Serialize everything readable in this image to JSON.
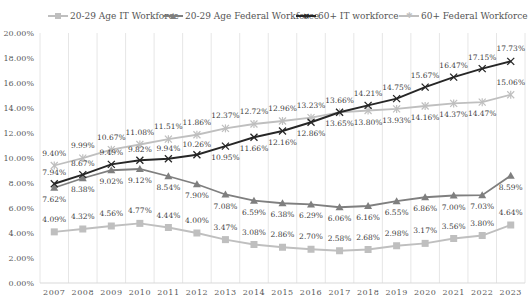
{
  "chart_data": {
    "type": "line",
    "title": "",
    "xlabel": "",
    "ylabel": "",
    "x": [
      "2007",
      "2008",
      "2009",
      "2010",
      "2011",
      "2012",
      "2013",
      "2014",
      "2015",
      "2016",
      "2017",
      "2018",
      "2019",
      "2020",
      "2021",
      "2022",
      "2023"
    ],
    "ylim": [
      0,
      20
    ],
    "yticks": [
      "0.00%",
      "2.00%",
      "4.00%",
      "6.00%",
      "8.00%",
      "10.00%",
      "12.00%",
      "14.00%",
      "16.00%",
      "18.00%",
      "20.00%"
    ],
    "grid": {
      "vertical": true,
      "horizontal": false
    },
    "legend_position": "top",
    "series": [
      {
        "name": "20-29 Age IT Workforce",
        "color": "#bfbfbf",
        "marker": "square",
        "values": [
          4.09,
          4.32,
          4.56,
          4.77,
          4.44,
          4.0,
          3.47,
          3.08,
          2.86,
          2.7,
          2.58,
          2.68,
          2.98,
          3.17,
          3.56,
          3.8,
          4.64
        ],
        "labels": [
          "4.09%",
          "4.32%",
          "4.56%",
          "4.77%",
          "4.44%",
          "4.00%",
          "3.47%",
          "3.08%",
          "2.86%",
          "2.70%",
          "2.58%",
          "2.68%",
          "2.98%",
          "3.17%",
          "3.56%",
          "3.80%",
          "4.64%"
        ]
      },
      {
        "name": "20-29 Age Federal Workforce",
        "color": "#7f7f7f",
        "marker": "triangle",
        "values": [
          7.62,
          8.38,
          9.02,
          9.12,
          8.54,
          7.9,
          7.08,
          6.59,
          6.38,
          6.29,
          6.06,
          6.16,
          6.55,
          6.86,
          7.0,
          7.03,
          8.59
        ],
        "labels": [
          "7.62%",
          "8.38%",
          "9.02%",
          "9.12%",
          "8.54%",
          "7.90%",
          "7.08%",
          "6.59%",
          "6.38%",
          "6.29%",
          "6.06%",
          "6.16%",
          "6.55%",
          "6.86%",
          "7.00%",
          "7.03%",
          "8.59%"
        ]
      },
      {
        "name": "60+ IT workforce",
        "color": "#262626",
        "marker": "x",
        "values": [
          7.94,
          8.67,
          9.49,
          9.82,
          9.94,
          10.26,
          10.95,
          11.66,
          12.16,
          12.86,
          13.66,
          14.21,
          14.75,
          15.67,
          16.47,
          17.15,
          17.73
        ],
        "labels": [
          "7.94%",
          "8.67%",
          "9.49%",
          "9.82%",
          "9.94%",
          "10.26%",
          "10.95%",
          "11.66%",
          "12.16%",
          "12.86%",
          "13.66%",
          "14.21%",
          "14.75%",
          "15.67%",
          "16.47%",
          "17.15%",
          "17.73%"
        ]
      },
      {
        "name": "60+ Federal Workforce",
        "color": "#bfbfbf",
        "marker": "star",
        "values": [
          9.4,
          9.99,
          10.67,
          11.08,
          11.51,
          11.86,
          12.37,
          12.72,
          12.96,
          13.23,
          13.65,
          13.8,
          13.93,
          14.16,
          14.37,
          14.47,
          15.06
        ],
        "labels": [
          "9.40%",
          "9.99%",
          "10.67%",
          "11.08%",
          "11.51%",
          "11.86%",
          "12.37%",
          "12.72%",
          "12.96%",
          "13.23%",
          "13.65%",
          "13.80%",
          "13.93%",
          "14.16%",
          "14.37%",
          "14.47%",
          "15.06%"
        ]
      }
    ]
  },
  "legend": {
    "items": [
      {
        "label": "20-29 Age IT Workforce",
        "icon": "square-marker-icon"
      },
      {
        "label": "20-29 Age Federal Workforce",
        "icon": "triangle-marker-icon"
      },
      {
        "label": "60+ IT workforce",
        "icon": "x-marker-icon"
      },
      {
        "label": "60+ Federal Workforce",
        "icon": "star-marker-icon"
      }
    ]
  }
}
